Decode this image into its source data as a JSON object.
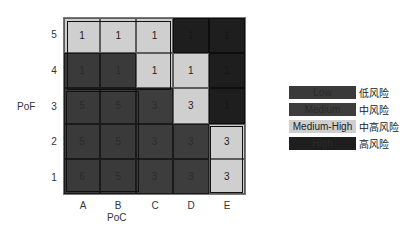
{
  "chart_data": {
    "type": "heatmap",
    "title": "",
    "xlabel": "PoC",
    "ylabel": "PoF",
    "x_categories": [
      "A",
      "B",
      "C",
      "D",
      "E"
    ],
    "y_categories": [
      "5",
      "4",
      "3",
      "2",
      "1"
    ],
    "values": [
      [
        "1",
        "1",
        "1",
        "1",
        "1"
      ],
      [
        "1",
        "1",
        "1",
        "1",
        "1"
      ],
      [
        "5",
        "5",
        "3",
        "3",
        "1"
      ],
      [
        "5",
        "5",
        "3",
        "3",
        "3"
      ],
      [
        "6",
        "5",
        "3",
        "3",
        "3"
      ]
    ],
    "risk_levels": [
      [
        "medhigh",
        "medhigh",
        "medhigh",
        "high",
        "high"
      ],
      [
        "low",
        "low",
        "medhigh",
        "medhigh",
        "high"
      ],
      [
        "low",
        "low",
        "medium",
        "medhigh",
        "high"
      ],
      [
        "low",
        "low",
        "medium",
        "medium",
        "medhigh"
      ],
      [
        "low",
        "low",
        "medium",
        "medium",
        "medhigh"
      ]
    ],
    "legend": [
      {
        "key": "low",
        "label": "Low",
        "label_cn": "低风险",
        "color": "#3a3a3a"
      },
      {
        "key": "medium",
        "label": "Medium",
        "label_cn": "中风险",
        "color": "#3d3d3d"
      },
      {
        "key": "medhigh",
        "label": "Medium-High",
        "label_cn": "中高风险",
        "color": "#cfcfcf"
      },
      {
        "key": "high",
        "label": "High",
        "label_cn": "高风险",
        "color": "#1e1e1e"
      }
    ],
    "legend_position": "right"
  }
}
